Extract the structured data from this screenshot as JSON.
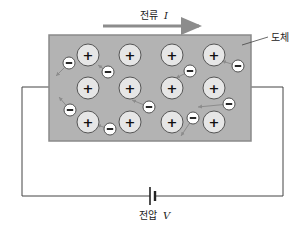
{
  "diagram": {
    "current_label": "전류",
    "current_symbol": "I",
    "conductor_label": "도체",
    "voltage_label": "전압",
    "voltage_symbol": "V",
    "colors": {
      "conductor_fill": "#b3b3b3",
      "conductor_border": "#8a8a8a",
      "ion_fill": "#e6e6e6",
      "electron_fill": "#ffffff",
      "arrow": "#8c8c8c",
      "wire": "#444444"
    },
    "ions": {
      "symbol": "+",
      "count": 12,
      "rows": 3,
      "cols": 4
    },
    "electrons": {
      "symbol": "−",
      "count": 9
    }
  }
}
